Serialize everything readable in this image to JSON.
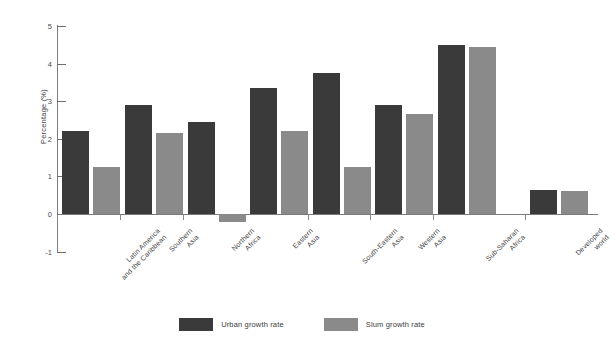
{
  "chart_data": {
    "type": "bar",
    "title": "",
    "xlabel": "",
    "ylabel": "Percentage (%)",
    "ylim": [
      -1,
      5
    ],
    "yticks": [
      5,
      4,
      3,
      2,
      1,
      0,
      -1
    ],
    "ytick_labels": [
      "5",
      "4",
      "3",
      "2",
      "1",
      "0",
      "-1"
    ],
    "grid": false,
    "legend_position": "bottom-center",
    "categories": [
      "Latin America\nand the Caribbean",
      "Southern\nAsia",
      "Northern\nAfrica",
      "Eastern\nAsia",
      "South-Eastern\nAsia",
      "Western\nAsia",
      "Sub-Saharan\nAfrica",
      "Developed\nworld"
    ],
    "series": [
      {
        "name": "Urban growth rate",
        "color": "#3a3a3a",
        "values": [
          2.2,
          2.9,
          2.45,
          3.35,
          3.75,
          2.9,
          4.5,
          0.65
        ]
      },
      {
        "name": "Slum growth rate",
        "color": "#8a8a8a",
        "values": [
          1.25,
          2.15,
          -0.2,
          2.2,
          1.25,
          2.65,
          4.45,
          0.6
        ]
      }
    ]
  },
  "axes": {
    "y_axis_title": "Percentage (%)"
  },
  "legend": {
    "items": [
      {
        "label": "Urban growth rate",
        "color": "#3a3a3a"
      },
      {
        "label": "Slum growth rate",
        "color": "#8a8a8a"
      }
    ]
  },
  "colors": {
    "urban": "#3a3a3a",
    "slum": "#8a8a8a",
    "axis": "#7a7a7a",
    "text": "#3f3f3f",
    "background": "#ffffff"
  }
}
